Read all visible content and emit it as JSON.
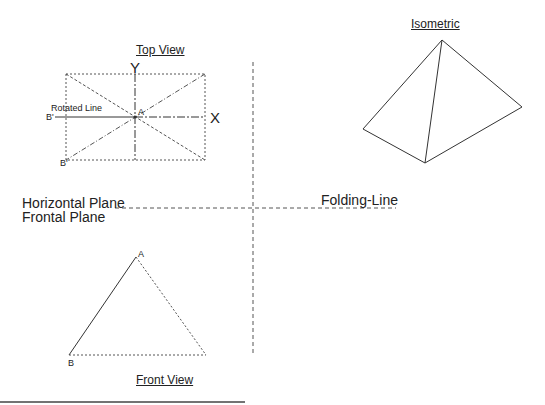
{
  "top_view": {
    "title": "Top View",
    "axis_y": "Y",
    "axis_x": "X",
    "point_a": "A",
    "point_b_prime": "B'",
    "point_b": "B'",
    "rotated_line_label": "Rotated Line"
  },
  "isometric": {
    "title": "Isometric"
  },
  "planes": {
    "horizontal": "Horizontal Plane",
    "frontal": "Frontal Plane",
    "folding_line": "Folding-Line"
  },
  "front_view": {
    "title": "Front View",
    "point_a": "A",
    "point_b": "B"
  },
  "colors": {
    "line": "#333333",
    "dashed": "#555555",
    "background": "#ffffff"
  }
}
